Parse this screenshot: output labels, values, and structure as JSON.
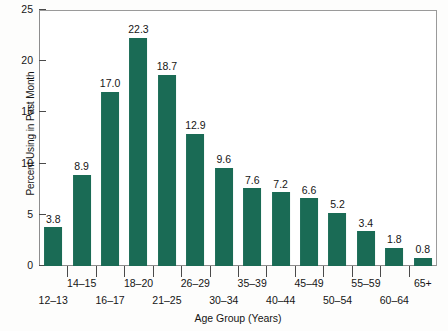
{
  "chart_data": {
    "type": "bar",
    "title": "",
    "xlabel": "Age Group (Years)",
    "ylabel": "Percent Using in Past Month",
    "ylim": [
      0,
      25
    ],
    "yticks": [
      0,
      5,
      10,
      15,
      20,
      25
    ],
    "grid": false,
    "legend": null,
    "bar_color": "#1a6b55",
    "categories": [
      "12–13",
      "14–15",
      "16–17",
      "18–20",
      "21–25",
      "26–29",
      "30–34",
      "35–39",
      "40–44",
      "45–49",
      "50–54",
      "55–59",
      "60–64",
      "65+"
    ],
    "values": [
      3.8,
      8.9,
      17.0,
      22.3,
      18.7,
      12.9,
      9.6,
      7.6,
      7.2,
      6.6,
      5.2,
      3.4,
      1.8,
      0.8
    ],
    "value_labels": [
      "3.8",
      "8.9",
      "17.0",
      "22.3",
      "18.7",
      "12.9",
      "9.6",
      "7.6",
      "7.2",
      "6.6",
      "5.2",
      "3.4",
      "1.8",
      "0.8"
    ],
    "ytick_labels": [
      "0",
      "5",
      "10",
      "15",
      "20",
      "25"
    ],
    "label_rows": [
      "lower",
      "upper",
      "lower",
      "upper",
      "lower",
      "upper",
      "lower",
      "upper",
      "lower",
      "upper",
      "lower",
      "upper",
      "lower",
      "upper"
    ]
  }
}
